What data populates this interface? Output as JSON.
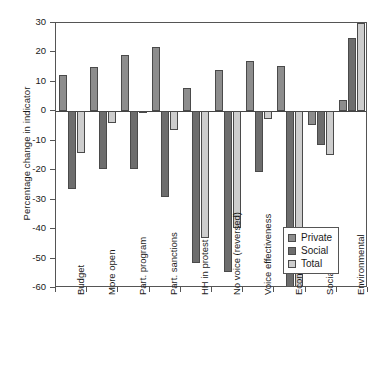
{
  "chart_data": {
    "type": "bar",
    "title": "",
    "xlabel": "",
    "ylabel": "Percentage change in indicator",
    "ylim": [
      -60,
      30
    ],
    "yticks": [
      30,
      20,
      10,
      0,
      -10,
      -20,
      -30,
      -40,
      -50,
      -60
    ],
    "ytick_labels": [
      "30",
      "20",
      "10",
      "0",
      "-10",
      "-20",
      "-30",
      "-40",
      "-50",
      "-60"
    ],
    "grid": false,
    "legend_position": "bottom-right",
    "categories": [
      "Budget",
      "More open",
      "Part. program",
      "Part. sanctions",
      "HH in protest",
      "No voice (reversed)",
      "Voice effectiveness",
      "Economic",
      "Social",
      "Environmental"
    ],
    "series": [
      {
        "name": "Private",
        "color": "#8d8d8d",
        "values": [
          12.5,
          15.0,
          19.0,
          22.0,
          8.0,
          14.0,
          17.0,
          15.5,
          -4.5,
          4.0
        ]
      },
      {
        "name": "Social",
        "color": "#6d6d6d",
        "values": [
          -26.5,
          -19.5,
          -19.5,
          -29.0,
          -51.5,
          -54.5,
          -20.5,
          -61.0,
          -11.5,
          25.0
        ]
      },
      {
        "name": "Total",
        "color": "#cdcdcd",
        "values": [
          -14.0,
          -4.0,
          -0.3,
          -6.5,
          -43.0,
          -39.5,
          -2.5,
          -61.0,
          -15.0,
          30.0
        ]
      }
    ]
  },
  "legend": {
    "items": [
      {
        "label": "Private"
      },
      {
        "label": "Social"
      },
      {
        "label": "Total"
      }
    ]
  }
}
